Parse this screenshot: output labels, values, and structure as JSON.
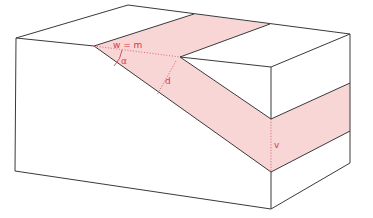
{
  "diagram": {
    "title": "",
    "labels": {
      "outcrop_width": "w = m",
      "dip_angle": "α",
      "true_thickness": "d",
      "vertical_thickness": "v"
    },
    "colors": {
      "layer_fill": "#f8d6d6",
      "block_fill": "#ffffff",
      "edge": "#3a3a3a",
      "annotation": "#d63a46"
    }
  }
}
